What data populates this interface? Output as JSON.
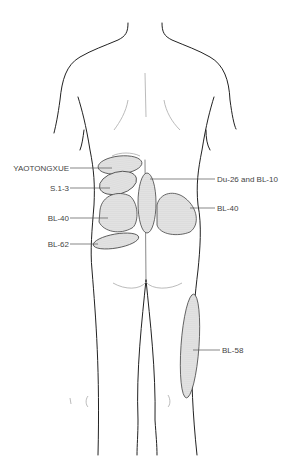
{
  "figure": {
    "labels": {
      "yaotongxue": "YAOTONGXUE",
      "s1_3": "S.1-3",
      "bl40_left": "BL-40",
      "bl62": "BL-62",
      "du26_bl10": "Du-26 and BL-10",
      "bl40_right": "BL-40",
      "bl58": "BL-58"
    },
    "colors": {
      "outline": "#222222",
      "zone_fill": "#dcdcdc",
      "text": "#444444"
    }
  }
}
